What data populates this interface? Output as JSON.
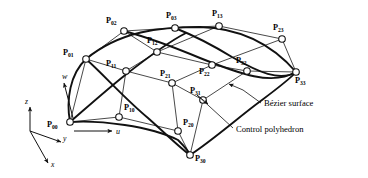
{
  "figure": {
    "type": "technical-diagram",
    "background_color": "#ffffff",
    "line_color": "#111111",
    "node_fill_color": "#ffffff"
  },
  "control_points": [
    {
      "id": "P00",
      "base": "P",
      "sub": "00",
      "x": 70,
      "y": 122,
      "label_x": 47,
      "label_y": 127
    },
    {
      "id": "P01",
      "base": "P",
      "sub": "01",
      "x": 86,
      "y": 59,
      "label_x": 63,
      "label_y": 55
    },
    {
      "id": "P02",
      "base": "P",
      "sub": "02",
      "x": 124,
      "y": 31,
      "label_x": 106,
      "label_y": 23
    },
    {
      "id": "P03",
      "base": "P",
      "sub": "03",
      "x": 175,
      "y": 28,
      "label_x": 166,
      "label_y": 18
    },
    {
      "id": "P10",
      "base": "P",
      "sub": "10",
      "x": 119,
      "y": 117,
      "label_x": 124,
      "label_y": 110
    },
    {
      "id": "P11",
      "base": "P",
      "sub": "11",
      "x": 126,
      "y": 71,
      "label_x": 106,
      "label_y": 66
    },
    {
      "id": "P12",
      "base": "P",
      "sub": "12",
      "x": 157,
      "y": 52,
      "label_x": 147,
      "label_y": 43
    },
    {
      "id": "P13",
      "base": "P",
      "sub": "13",
      "x": 219,
      "y": 26,
      "label_x": 212,
      "label_y": 16
    },
    {
      "id": "P20",
      "base": "P",
      "sub": "20",
      "x": 178,
      "y": 131,
      "label_x": 183,
      "label_y": 125
    },
    {
      "id": "P21",
      "base": "P",
      "sub": "21",
      "x": 172,
      "y": 83,
      "label_x": 160,
      "label_y": 76
    },
    {
      "id": "P22",
      "base": "P",
      "sub": "22",
      "x": 212,
      "y": 65,
      "label_x": 199,
      "label_y": 74
    },
    {
      "id": "P23",
      "base": "P",
      "sub": "23",
      "x": 282,
      "y": 39,
      "label_x": 273,
      "label_y": 30
    },
    {
      "id": "P30",
      "base": "P",
      "sub": "30",
      "x": 190,
      "y": 155,
      "label_x": 195,
      "label_y": 161
    },
    {
      "id": "P31",
      "base": "P",
      "sub": "31",
      "x": 203,
      "y": 100,
      "label_x": 190,
      "label_y": 93
    },
    {
      "id": "P32",
      "base": "P",
      "sub": "32",
      "x": 247,
      "y": 71,
      "label_x": 236,
      "label_y": 63
    },
    {
      "id": "P33",
      "base": "P",
      "sub": "33",
      "x": 296,
      "y": 72,
      "label_x": 295,
      "label_y": 83
    }
  ],
  "polyhedron_edges": [
    [
      "P00",
      "P01"
    ],
    [
      "P01",
      "P02"
    ],
    [
      "P02",
      "P03"
    ],
    [
      "P10",
      "P11"
    ],
    [
      "P11",
      "P12"
    ],
    [
      "P12",
      "P13"
    ],
    [
      "P20",
      "P21"
    ],
    [
      "P21",
      "P22"
    ],
    [
      "P22",
      "P23"
    ],
    [
      "P30",
      "P31"
    ],
    [
      "P31",
      "P32"
    ],
    [
      "P32",
      "P33"
    ],
    [
      "P00",
      "P10"
    ],
    [
      "P10",
      "P20"
    ],
    [
      "P20",
      "P30"
    ],
    [
      "P01",
      "P11"
    ],
    [
      "P11",
      "P21"
    ],
    [
      "P21",
      "P31"
    ],
    [
      "P02",
      "P12"
    ],
    [
      "P12",
      "P22"
    ],
    [
      "P22",
      "P32"
    ],
    [
      "P03",
      "P13"
    ],
    [
      "P13",
      "P23"
    ],
    [
      "P23",
      "P33"
    ]
  ],
  "surface_curves": [
    {
      "name": "u-boundary-w0",
      "d": "M 70,122 C 100,120 150,126 178,140 C 186,148 189,152 190,155"
    },
    {
      "name": "u-boundary-w1",
      "d": "M 86,59 C 120,31 160,27 200,27 C 238,28 270,42 296,72"
    },
    {
      "name": "w-boundary-u0",
      "d": "M 70,122 C 66,100 70,74 86,59"
    },
    {
      "name": "w-boundary-u1",
      "d": "M 190,155 C 213,140 240,116 262,100 C 278,88 290,79 296,72"
    },
    {
      "name": "interior-iso-a",
      "d": "M 124,31 C 150,38 176,48 200,58 C 240,74 272,86 296,72"
    },
    {
      "name": "interior-iso-b",
      "d": "M 175,28 C 195,36 214,46 232,57 C 258,72 280,82 296,72"
    },
    {
      "name": "interior-iso-c",
      "d": "M 86,59 C 104,75 124,98 148,118 C 166,134 180,148 190,155"
    },
    {
      "name": "interior-iso-d",
      "d": "M 70,122 C 84,110 104,92 124,76 C 152,54 172,40 186,33"
    }
  ],
  "axes": {
    "origin": {
      "x": 30,
      "y": 131
    },
    "items": [
      {
        "name": "z",
        "label": "z",
        "tip_x": 30,
        "tip_y": 107,
        "label_x": 25,
        "label_y": 104
      },
      {
        "name": "y",
        "label": "y",
        "tip_x": 61,
        "tip_y": 142,
        "label_x": 63,
        "label_y": 141
      },
      {
        "name": "x",
        "label": "x",
        "tip_x": 48,
        "tip_y": 163,
        "label_x": 51,
        "label_y": 167
      }
    ]
  },
  "parameter_arrows": [
    {
      "name": "u",
      "label": "u",
      "start_x": 74,
      "start_y": 131,
      "tip_x": 112,
      "tip_y": 131,
      "label_x": 116,
      "label_y": 134
    },
    {
      "name": "w",
      "label": "w",
      "start_x": 73,
      "start_y": 118,
      "tip_x": 64,
      "tip_y": 83,
      "label_x": 62,
      "label_y": 79
    }
  ],
  "annotations": [
    {
      "name": "bezier-surface",
      "text": "Bézier surface",
      "text_x": 264,
      "text_y": 106,
      "leader": "M 261,103 L 243,90"
    },
    {
      "name": "control-polyhedron",
      "text": "Control polyhedron",
      "text_x": 236,
      "text_y": 132,
      "leader": "M 233,128 L 197,95"
    }
  ],
  "annotation_pointer_arrows": [
    {
      "name": "surface-pointer-arrow",
      "d": "M 243,90 L 229,84",
      "tip_x": 227,
      "tip_y": 83
    },
    {
      "name": "polyhedron-pointer-arrow",
      "d": "M 197,95 L 208,104",
      "tip_x": 210,
      "tip_y": 106
    }
  ]
}
